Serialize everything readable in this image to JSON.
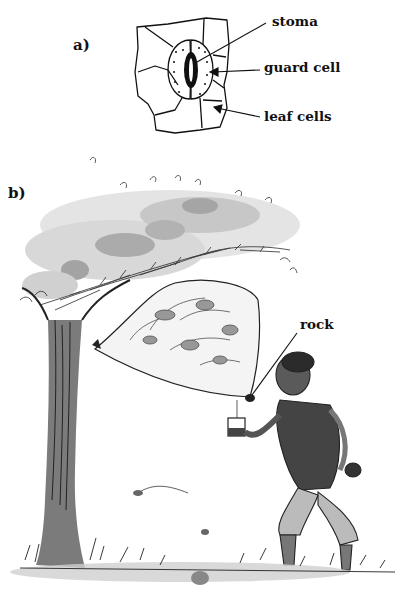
{
  "panels": {
    "a": {
      "label": "a)",
      "title": "stomata diagram",
      "callouts": [
        {
          "id": "stoma",
          "text": "stoma"
        },
        {
          "id": "guard_cell",
          "text": "guard cell"
        },
        {
          "id": "leaf_cells",
          "text": "leaf cells"
        }
      ]
    },
    "b": {
      "label": "b)",
      "title": "transpiration bag experiment illustration",
      "callouts": [
        {
          "id": "rock",
          "text": "rock"
        }
      ]
    }
  },
  "colors": {
    "ink": "#111111",
    "wash_light": "#d9d9d9",
    "wash_mid": "#a8a8a8",
    "wash_dark": "#6e6e6e",
    "background": "#ffffff"
  }
}
